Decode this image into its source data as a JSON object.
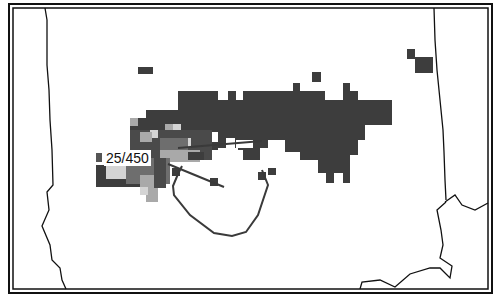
{
  "map": {
    "type": "radar-coverage-map",
    "colors": {
      "heavy": "#3d3d3d",
      "medium": "#6e6e6e",
      "light": "#a9a9a9",
      "lightest": "#d4d4d4",
      "border": "#111111",
      "track": "#3a3a3a",
      "background": "#ffffff"
    },
    "label": {
      "text": "25/450",
      "marker_color": "#555555"
    },
    "layers": [
      "state-boundaries",
      "precipitation-cells",
      "storm-track"
    ]
  }
}
